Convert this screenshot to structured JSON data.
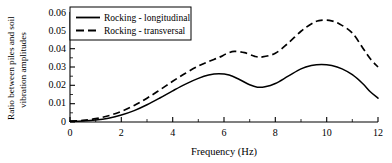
{
  "chart_data": {
    "type": "line",
    "title": "",
    "xlabel": "Frequency (Hz)",
    "ylabel_line1": "Ratio between piles and soil",
    "ylabel_line2": "vibration amplitudes",
    "xlim": [
      0,
      12
    ],
    "ylim": [
      0,
      0.06
    ],
    "xticks": [
      0,
      2,
      4,
      6,
      8,
      10,
      12
    ],
    "xtick_labels": [
      "0",
      "2",
      "4",
      "6",
      "8",
      "10",
      "12"
    ],
    "yticks": [
      0,
      0.01,
      0.02,
      0.03,
      0.04,
      0.05,
      0.06
    ],
    "ytick_labels": [
      "0",
      "0.01",
      "0.02",
      "0.03",
      "0.04",
      "0.05",
      "0.06"
    ],
    "minor_ticks": true,
    "grid": false,
    "legend_position": "upper-left",
    "series": [
      {
        "name": "Rocking - longitudinal",
        "style": "solid",
        "color": "#000000",
        "x": [
          0,
          0.5,
          1.0,
          1.5,
          2.0,
          2.5,
          3.0,
          3.5,
          4.0,
          4.5,
          5.0,
          5.4,
          5.8,
          6.2,
          6.6,
          7.0,
          7.3,
          7.6,
          8.0,
          8.5,
          9.0,
          9.4,
          9.8,
          10.2,
          10.6,
          11.0,
          11.4,
          11.7,
          12.0
        ],
        "y": [
          0.0004,
          0.0006,
          0.0011,
          0.0021,
          0.0038,
          0.0062,
          0.0094,
          0.0131,
          0.017,
          0.0207,
          0.0238,
          0.0256,
          0.0263,
          0.0256,
          0.0232,
          0.0203,
          0.019,
          0.0192,
          0.021,
          0.025,
          0.029,
          0.0308,
          0.0314,
          0.0308,
          0.029,
          0.0258,
          0.021,
          0.0165,
          0.013
        ]
      },
      {
        "name": "Rocking - transversal",
        "style": "dashed",
        "color": "#000000",
        "x": [
          0,
          0.5,
          1.0,
          1.5,
          2.0,
          2.5,
          3.0,
          3.5,
          4.0,
          4.5,
          5.0,
          5.4,
          5.8,
          6.1,
          6.4,
          6.8,
          7.2,
          7.5,
          8.0,
          8.5,
          9.0,
          9.4,
          9.7,
          10.1,
          10.5,
          11.0,
          11.4,
          11.7,
          12.0
        ],
        "y": [
          0.0005,
          0.0009,
          0.0018,
          0.0034,
          0.0058,
          0.009,
          0.013,
          0.0175,
          0.0222,
          0.0266,
          0.0305,
          0.033,
          0.0352,
          0.0372,
          0.0385,
          0.0378,
          0.0358,
          0.0355,
          0.0375,
          0.043,
          0.0495,
          0.0535,
          0.0553,
          0.0554,
          0.0535,
          0.0485,
          0.0405,
          0.0345,
          0.03
        ]
      }
    ]
  },
  "legend": {
    "entries": [
      {
        "label": "Rocking - longitudinal",
        "style": "solid"
      },
      {
        "label": "Rocking - transversal",
        "style": "dashed"
      }
    ]
  }
}
